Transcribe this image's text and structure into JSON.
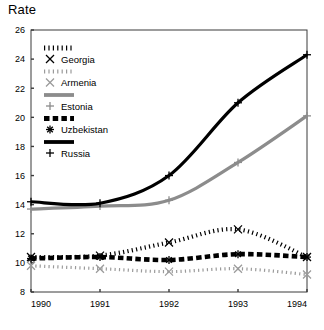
{
  "chart_data": {
    "type": "line",
    "title": "Rate",
    "xlabel": "",
    "ylabel": "Rate",
    "x": [
      1990,
      1991,
      1992,
      1993,
      1994
    ],
    "xtick_labels": [
      "1990",
      "1991",
      "1992",
      "1993",
      "1994"
    ],
    "ytick_labels": [
      "8",
      "10",
      "12",
      "14",
      "16",
      "18",
      "20",
      "22",
      "24",
      "26"
    ],
    "ytick_values": [
      8,
      10,
      12,
      14,
      16,
      18,
      20,
      22,
      24,
      26
    ],
    "xlim": [
      1990,
      1994
    ],
    "ylim": [
      8,
      26
    ],
    "grid": false,
    "legend_position": "upper-left",
    "series": [
      {
        "name": "Georgia",
        "color": "#000000",
        "style": "dotted",
        "marker": "x",
        "values": [
          10.4,
          10.5,
          11.4,
          12.3,
          10.4
        ]
      },
      {
        "name": "Armenia",
        "color": "#9a9a9a",
        "style": "dotted",
        "marker": "x",
        "values": [
          9.8,
          9.6,
          9.4,
          9.6,
          9.2
        ]
      },
      {
        "name": "Estonia",
        "color": "#8c8c8c",
        "style": "solid",
        "marker": "plus",
        "values": [
          13.7,
          13.9,
          14.3,
          16.9,
          20.1
        ]
      },
      {
        "name": "Uzbekistan",
        "color": "#000000",
        "style": "dashed",
        "marker": "asterisk",
        "values": [
          10.3,
          10.4,
          10.2,
          10.6,
          10.4
        ]
      },
      {
        "name": "Russia",
        "color": "#000000",
        "style": "solid",
        "marker": "plus",
        "values": [
          14.2,
          14.1,
          16.0,
          21.0,
          24.3
        ]
      }
    ]
  }
}
